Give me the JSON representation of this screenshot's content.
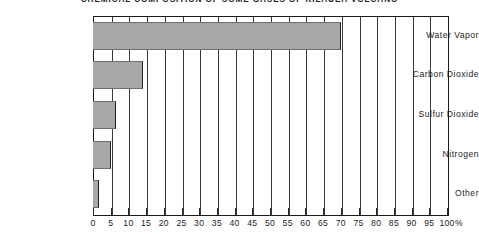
{
  "chart_data": {
    "type": "bar",
    "orientation": "horizontal",
    "title": "CHEMICAL COMPOSITION OF SOME GASES OF KILAUEA VOLCANO",
    "xlabel": "",
    "ylabel": "",
    "unit": "%",
    "categories": [
      "Water Vapor",
      "Carbon Dioxide",
      "Sulfur Dioxide",
      "Nitrogen",
      "Other"
    ],
    "values": [
      70,
      14,
      6.5,
      5,
      1.7
    ],
    "xlim": [
      0,
      100
    ],
    "xticks": [
      0,
      5,
      10,
      15,
      20,
      25,
      30,
      35,
      40,
      45,
      50,
      55,
      60,
      65,
      70,
      75,
      80,
      85,
      90,
      95,
      100
    ],
    "xtick_labels": [
      "0",
      "5",
      "10",
      "15",
      "20",
      "25",
      "30",
      "35",
      "40",
      "45",
      "50",
      "55",
      "60",
      "65",
      "70",
      "75",
      "80",
      "85",
      "90",
      "95",
      "100"
    ],
    "grid": true,
    "legend": false,
    "bar_color": "#a8a8a8",
    "axis_color": "#1a1a1a"
  }
}
